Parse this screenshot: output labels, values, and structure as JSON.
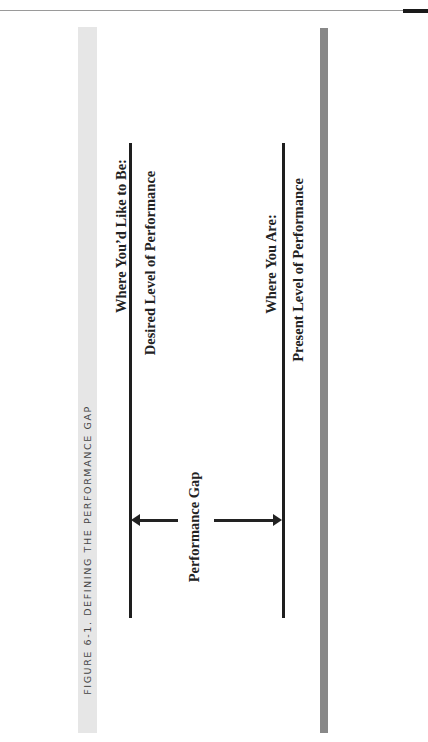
{
  "figure": {
    "caption": "FIGURE 6-1. DEFINING THE PERFORMANCE GAP",
    "desired": {
      "heading": "Where You’d Like to Be:",
      "subheading": "Desired Level of Performance"
    },
    "present": {
      "heading": "Where You Are:",
      "subheading": "Present Level of Performance"
    },
    "gap_label": "Performance Gap"
  },
  "colors": {
    "caption_band": "#e6e6e6",
    "side_band": "#888888",
    "line": "#1e1e1e"
  }
}
